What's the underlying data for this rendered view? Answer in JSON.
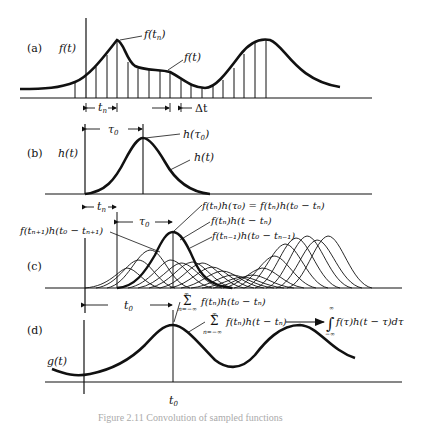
{
  "figure": {
    "caption": "Figure 2.11 Convolution of sampled functions",
    "panels": [
      {
        "id": "a",
        "label": "(a)",
        "y_axis_label": "f(t)",
        "annotations": [
          "f(t_n)",
          "f(t)"
        ],
        "dimension_labels": [
          "t_n",
          "Δt"
        ]
      },
      {
        "id": "b",
        "label": "(b)",
        "y_axis_label": "h(t)",
        "annotations": [
          "h(τ0)",
          "h(t)"
        ],
        "dimension_labels": [
          "τ0"
        ]
      },
      {
        "id": "c",
        "label": "(c)",
        "annotations": [
          "f(t_n)h(τ0) = f(t_n)h(t0 − t_n)",
          "f(t_n)h(t − t_n)",
          "f(t_{n−1})h(t0 − t_{n−1})",
          "f(t_{n+1})h(t0 − t_{n+1})"
        ],
        "dimension_labels": [
          "t_n",
          "τ0"
        ]
      },
      {
        "id": "d",
        "label": "(d)",
        "y_axis_label": "g(t)",
        "x_tick": "t0",
        "annotations": [
          "Σ_{n=−∞}^{∞} f(t_n)h(t0 − t_n)",
          "Σ_{n=−∞}^{∞} f(t_n)h(t − t_n)",
          "∫_{−∞}^{∞} f(τ)h(t − τ)dτ"
        ],
        "dimension_labels": [
          "t0"
        ]
      }
    ]
  },
  "text": {
    "a_label": "(a)",
    "b_label": "(b)",
    "c_label": "(c)",
    "d_label": "(d)",
    "f_of_t": "f(t)",
    "h_of_t": "h(t)",
    "g_of_t": "g(t)",
    "t_n": "t",
    "n_sub": "n",
    "delta_t": "Δt",
    "tau0": "τ",
    "zero_sub": "0",
    "t0": "t",
    "f_tn": "f(t",
    "close_paren": ")",
    "h_tau0": "h(τ",
    "c_ann1": "f(tₙ)h(τ₀) = f(tₙ)h(t₀ − tₙ)",
    "c_ann2": "f(tₙ)h(t − tₙ)",
    "c_ann3": "f(tₙ₋₁)h(t₀ − tₙ₋₁)",
    "c_ann4": "f(tₙ₊₁)h(t₀ − tₙ₊₁)",
    "sum_sym": "Σ",
    "inf": "∞",
    "n_eq_minf": "n=−∞",
    "d_ann1": "f(tₙ)h(t₀ − tₙ)",
    "d_ann2": "f(tₙ)h(t − tₙ)",
    "int_sym": "∫",
    "minus_inf": "−∞",
    "d_ann3": "f(τ)h(t − τ)dτ",
    "caption": "Figure 2.11 Convolution of sampled functions"
  }
}
